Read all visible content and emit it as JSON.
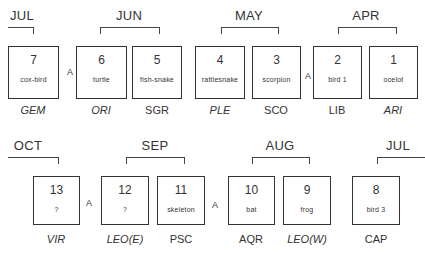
{
  "diagram": {
    "top_row": {
      "months": [
        {
          "label": "JUL",
          "x": 22,
          "y": 8
        },
        {
          "label": "JUN",
          "x": 129,
          "y": 8
        },
        {
          "label": "MAY",
          "x": 249,
          "y": 8
        },
        {
          "label": "APR",
          "x": 366,
          "y": 8
        }
      ],
      "boxes": [
        {
          "number": "7",
          "name": "cox-bird",
          "sign": "GEM",
          "sign_italic": true
        },
        {
          "number": "6",
          "name": "turtle",
          "sign": "ORI",
          "sign_italic": true
        },
        {
          "number": "5",
          "name": "fish-snake",
          "sign": "SGR",
          "sign_italic": false
        },
        {
          "number": "4",
          "name": "rattlesnake",
          "sign": "PLE",
          "sign_italic": true
        },
        {
          "number": "3",
          "name": "scorpion",
          "sign": "SCO",
          "sign_italic": false
        },
        {
          "number": "2",
          "name": "bird 1",
          "sign": "LIB",
          "sign_italic": false
        },
        {
          "number": "1",
          "name": "ocelot",
          "sign": "ARI",
          "sign_italic": true
        }
      ],
      "a_markers": [
        "A",
        "A"
      ]
    },
    "bottom_row": {
      "months": [
        {
          "label": "OCT",
          "x": 28,
          "y": 138
        },
        {
          "label": "SEP",
          "x": 155,
          "y": 138
        },
        {
          "label": "AUG",
          "x": 280,
          "y": 138
        },
        {
          "label": "JUL",
          "x": 398,
          "y": 138
        }
      ],
      "boxes": [
        {
          "number": "13",
          "name": "?",
          "sign": "VIR",
          "sign_italic": true
        },
        {
          "number": "12",
          "name": "?",
          "sign": "LEO(E)",
          "sign_italic": true
        },
        {
          "number": "11",
          "name": "skeleton",
          "sign": "PSC",
          "sign_italic": false
        },
        {
          "number": "10",
          "name": "bat",
          "sign": "AQR",
          "sign_italic": false
        },
        {
          "number": "9",
          "name": "frog",
          "sign": "LEO(W)",
          "sign_italic": true
        },
        {
          "number": "8",
          "name": "bird 3",
          "sign": "CAP",
          "sign_italic": false
        }
      ],
      "a_markers": [
        "A",
        "A"
      ]
    }
  }
}
